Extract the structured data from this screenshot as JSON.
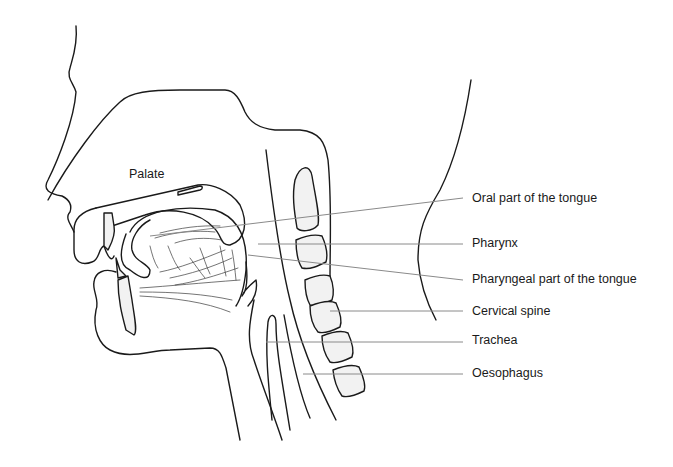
{
  "diagram": {
    "labels": {
      "palate": "Palate",
      "oral_tongue": "Oral part of the tongue",
      "pharynx": "Pharynx",
      "pharyngeal_tongue": "Pharyngeal part of the tongue",
      "cervical_spine": "Cervical spine",
      "trachea": "Trachea",
      "oesophagus": "Oesophagus"
    },
    "colors": {
      "outline": "#1a1a1a",
      "bone_fill": "#f2f2f2",
      "leader": "#8a8a8a",
      "text": "#1a1a1a"
    }
  }
}
